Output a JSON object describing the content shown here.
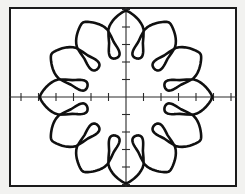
{
  "screen": {
    "kind": "graphing-calculator-screen",
    "background_color": "#ffffff",
    "bezel_color": "#f2f2f0",
    "frame_color": "#1b1b1b",
    "width_px": 245,
    "height_px": 194
  },
  "graph": {
    "axis_color": "#2a2a2a",
    "curve_color": "#101010",
    "origin_px": {
      "x": 117,
      "y": 90
    },
    "x_axis": {
      "visible": true,
      "tick_spacing_px": 17.5,
      "tick_half_length_px": 4,
      "tick_count_positive": 6,
      "tick_count_negative": 6
    },
    "y_axis": {
      "visible": true,
      "tick_spacing_px": 17.5,
      "tick_half_length_px": 4,
      "tick_count_positive": 5,
      "tick_count_negative": 5
    }
  },
  "chart_data": {
    "type": "line",
    "plot_kind": "polar",
    "title": "",
    "subtitle": "",
    "xlabel": "",
    "ylabel": "",
    "grid": false,
    "legend": "none",
    "axes": {
      "x_visible": true,
      "y_visible": true,
      "ticks": true
    },
    "xlim": [
      -6.7,
      6.3
    ],
    "ylim": [
      -5.1,
      5.1
    ],
    "series": [
      {
        "name": "r = a + b*cos(k*theta) with inner loops",
        "equation_form": "r = 4 + 1.35*cos(12*theta)",
        "petal_count": 12,
        "outer_radius_units": 4.9,
        "inner_loop_depth_units": 2.1,
        "theta_range_deg": [
          0,
          360
        ],
        "samples": 720
      }
    ],
    "curve_geometry": {
      "mean_radius_px": 82,
      "loop_count": 12,
      "loop_outer_radius_px": 86,
      "loop_inner_radius_px": 40,
      "loop_half_width_deg": 12,
      "phase_offset_deg": 0
    },
    "loop_positions_deg": [
      0,
      30,
      60,
      90,
      120,
      150,
      180,
      210,
      240,
      270,
      300,
      330
    ]
  }
}
